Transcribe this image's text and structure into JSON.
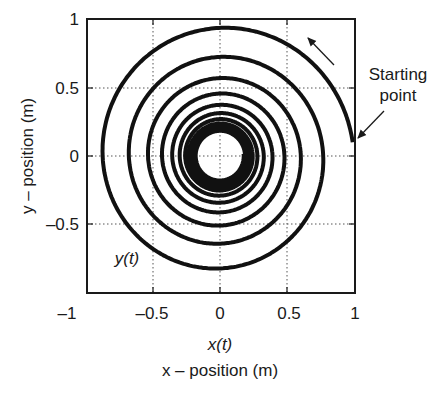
{
  "chart_data": {
    "type": "line",
    "title": "",
    "xlabel": "x – position (m)",
    "xlabel_var": "x(t)",
    "ylabel": "y – position (m)",
    "series_label": "y(t)",
    "xlim": [
      -1,
      1
    ],
    "ylim": [
      -1,
      1
    ],
    "xticks": [
      -1,
      -0.5,
      0,
      0.5,
      1
    ],
    "yticks": [
      -1,
      -0.5,
      0,
      0.5,
      1
    ],
    "xtick_labels": [
      "–1",
      "–0.5",
      "0",
      "0.5",
      "1"
    ],
    "ytick_labels": [
      "1",
      "0.5",
      "0",
      "–0.5"
    ],
    "grid": "dotted at ±0.5 and 0",
    "legend": "none",
    "spiral": {
      "description": "Decaying counter-clockwise spiral trajectory converging to a limit circle",
      "start_point": [
        0.99,
        0.1
      ],
      "limit_radius": 0.15,
      "initial_radius": 1.0,
      "decay_per_radian": 0.05,
      "turns": 11,
      "direction": "counter-clockwise"
    },
    "sampled_crossings": {
      "positive_y_axis_tops": [
        0.9,
        0.7,
        0.57
      ],
      "negative_x_axis": [
        -0.87,
        -0.68,
        -0.55,
        -0.47
      ],
      "negative_y_axis_bottoms": [
        -0.82,
        -0.68,
        -0.55
      ],
      "positive_x_axis": [
        0.8,
        0.64,
        0.52,
        0.45
      ]
    },
    "annotations": [
      {
        "text": "Starting point",
        "points_to": [
          1.0,
          0.1
        ]
      },
      {
        "text": "direction arrow",
        "type": "arrow",
        "direction": "up-left",
        "near": [
          0.85,
          0.75
        ]
      }
    ]
  },
  "labels": {
    "starting_line1": "Starting",
    "starting_line2": "point",
    "series": "y(t)",
    "x_var": "x(t)",
    "x_title": "x – position (m)",
    "y_title": "y – position (m)",
    "xt0": "–1",
    "xt1": "–0.5",
    "xt2": "0",
    "xt3": "0.5",
    "xt4": "1",
    "yt0": "1",
    "yt1": "0.5",
    "yt2": "0",
    "yt3": "–0.5"
  }
}
